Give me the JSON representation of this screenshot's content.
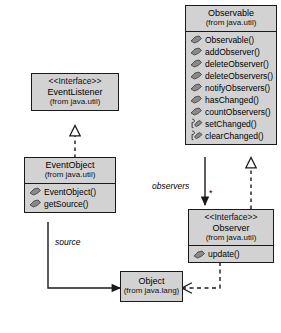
{
  "diagram": {
    "background": "#ffffff",
    "box_fill": "#d2d2d2",
    "box_border": "#1a1a1a"
  },
  "classes": {
    "observable": {
      "name": "Observable",
      "package": "(from java.util)",
      "stereotype": "",
      "operations": [
        {
          "label": "Observable()",
          "visibility": "public",
          "icon": "public-method-icon"
        },
        {
          "label": "addObserver()",
          "visibility": "public",
          "icon": "public-method-icon"
        },
        {
          "label": "deleteObserver()",
          "visibility": "public",
          "icon": "public-method-icon"
        },
        {
          "label": "deleteObservers()",
          "visibility": "public",
          "icon": "public-method-icon"
        },
        {
          "label": "notifyObservers()",
          "visibility": "public",
          "icon": "public-method-icon"
        },
        {
          "label": "hasChanged()",
          "visibility": "public",
          "icon": "public-method-icon"
        },
        {
          "label": "countObservers()",
          "visibility": "public",
          "icon": "public-method-icon"
        },
        {
          "label": "setChanged()",
          "visibility": "protected",
          "icon": "protected-method-icon"
        },
        {
          "label": "clearChanged()",
          "visibility": "protected",
          "icon": "protected-method-icon"
        }
      ]
    },
    "event_listener": {
      "name": "EventListener",
      "package": "(from java.util)",
      "stereotype": "<<Interface>>",
      "operations": []
    },
    "event_object": {
      "name": "EventObject",
      "package": "(from java.util)",
      "stereotype": "",
      "operations": [
        {
          "label": "EventObject()",
          "visibility": "public",
          "icon": "public-method-icon"
        },
        {
          "label": "getSource()",
          "visibility": "public",
          "icon": "public-method-icon"
        }
      ]
    },
    "observer": {
      "name": "Observer",
      "package": "(from java.util)",
      "stereotype": "<<Interface>>",
      "operations": [
        {
          "label": "update()",
          "visibility": "public",
          "icon": "public-method-icon"
        }
      ]
    },
    "object": {
      "name": "Object",
      "package": "(from java.lang)",
      "stereotype": "",
      "operations": []
    }
  },
  "relationships": {
    "observers_label": "observers",
    "observers_multiplicity": "*",
    "source_label": "source"
  }
}
